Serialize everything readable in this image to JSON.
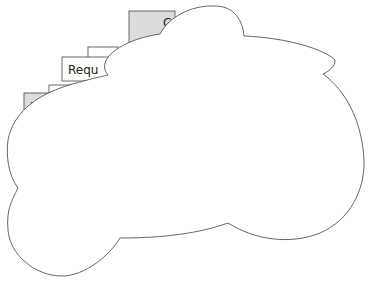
{
  "diagram": {
    "boxes": [
      {
        "id": "box-g",
        "label": "G",
        "fill": "#dcdcdc",
        "x": 129,
        "y": 11,
        "w": 46,
        "h": 32
      },
      {
        "id": "box-behind-top",
        "label": "",
        "fill": "#ffffff",
        "x": 88,
        "y": 47,
        "w": 30,
        "h": 14
      },
      {
        "id": "box-requ",
        "label": "Requ",
        "fill": "#ffffff",
        "x": 62,
        "y": 57,
        "w": 50,
        "h": 24
      },
      {
        "id": "box-behind-mid",
        "label": "",
        "fill": "#ffffff",
        "x": 49,
        "y": 85,
        "w": 28,
        "h": 14
      },
      {
        "id": "box-f",
        "label": "F",
        "fill": "#dcdcdc",
        "x": 24,
        "y": 93,
        "w": 30,
        "h": 25
      }
    ],
    "cloud": {
      "fill": "#ffffff",
      "stroke": "#555555"
    },
    "colors": {
      "box_stroke": "#444444",
      "gray_fill": "#dcdcdc"
    }
  }
}
